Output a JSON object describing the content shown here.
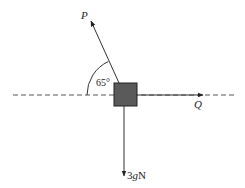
{
  "diagram": {
    "type": "force-diagram",
    "forces": [
      {
        "name": "P",
        "label": "P",
        "direction": "up-left",
        "angle_label": "65°"
      },
      {
        "name": "Q",
        "label": "Q",
        "direction": "right"
      },
      {
        "name": "weight",
        "label_num": "3",
        "label_var": "g",
        "label_unit": "N",
        "direction": "down"
      }
    ],
    "angle": {
      "value": "65°",
      "between": [
        "P",
        "horizontal"
      ]
    },
    "colors": {
      "line": "#333333",
      "box_fill": "#5a5a5a",
      "box_stroke": "#222222",
      "dash": "#555555"
    }
  }
}
